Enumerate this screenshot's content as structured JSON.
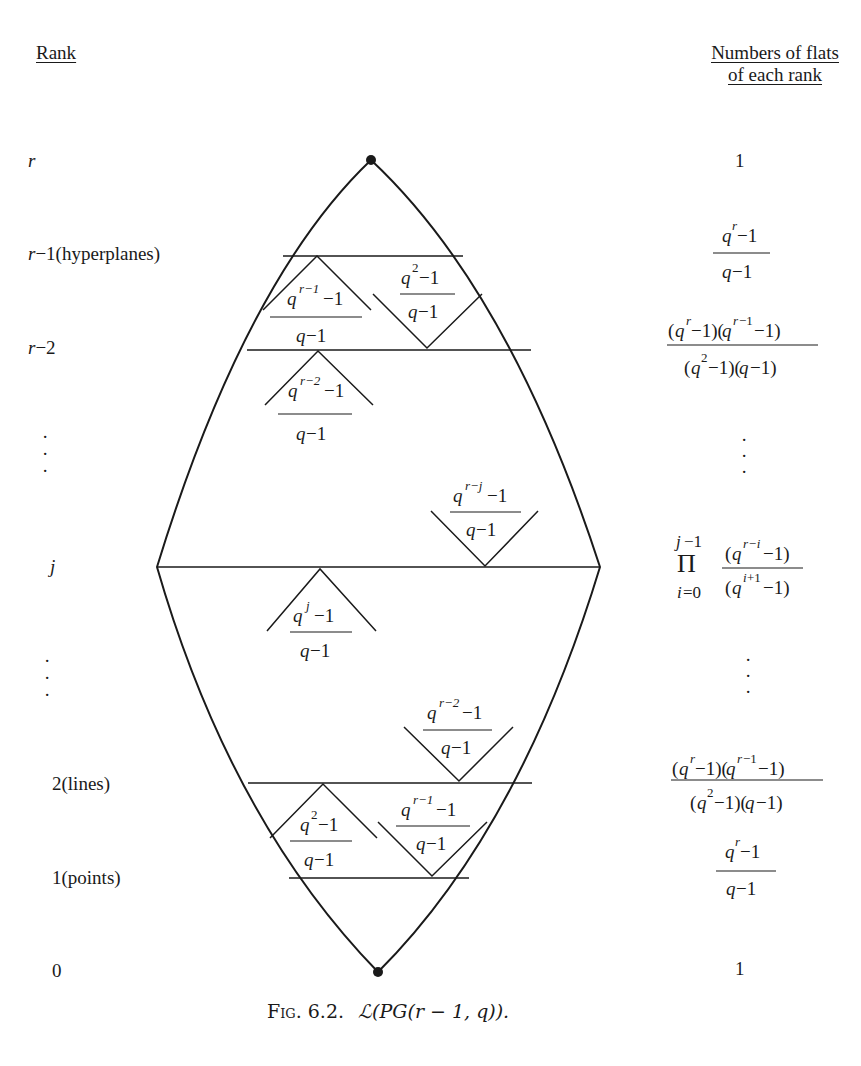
{
  "headers": {
    "rank": "Rank",
    "count_line1": "Numbers of flats",
    "count_line2": "of each rank"
  },
  "ranks": [
    {
      "label": "r",
      "italic": true
    },
    {
      "label": "r−1(hyperplanes)"
    },
    {
      "label": "r−2"
    },
    {
      "label": "⋮"
    },
    {
      "label": "j"
    },
    {
      "label": "⋮"
    },
    {
      "label": "2(lines)"
    },
    {
      "label": "1(points)"
    },
    {
      "label": "0"
    }
  ],
  "counts": {
    "r": "1",
    "r_minus_1": {
      "num_base": "q",
      "num_exp": "r",
      "num_tail": "−1",
      "den": "q−1"
    },
    "r_minus_2": {
      "num": "(q^r−1)(q^{r−1}−1)",
      "den": "(q^2−1)(q−1)"
    },
    "dots_upper": "⋮",
    "j": {
      "prod_top": "j−1",
      "prod_symbol": "Π",
      "prod_bottom": "i=0",
      "num": "(q^{r−i}−1)",
      "den": "(q^{i+1}−1)"
    },
    "dots_lower": "⋮",
    "two": {
      "num": "(q^r−1)(q^{r−1}−1)",
      "den": "(q^2−1)(q−1)"
    },
    "one": {
      "num": "q^r−1",
      "den": "q−1"
    },
    "zero": "1"
  },
  "wedge_labels": [
    {
      "id": "up-r-1",
      "exp": "r−1",
      "den": "q−1"
    },
    {
      "id": "down-2",
      "exp": "2",
      "den": "q−1"
    },
    {
      "id": "up-r-2",
      "exp": "r−2",
      "den": "q−1"
    },
    {
      "id": "down-r-j",
      "exp": "r−j",
      "den": "q−1"
    },
    {
      "id": "up-j",
      "exp": "j",
      "den": "q−1"
    },
    {
      "id": "down-r-2",
      "exp": "r−2",
      "den": "q−1"
    },
    {
      "id": "up-2",
      "exp": "2",
      "den": "q−1"
    },
    {
      "id": "down-r-1",
      "exp": "r−1",
      "den": "q−1"
    }
  ],
  "text_parts": {
    "q": "q",
    "minus_one": "−1"
  },
  "caption": {
    "fig": "Fig. 6.2.",
    "formula": "ℒ(PG(r − 1, q))."
  },
  "colors": {
    "ink": "#1a1a1a",
    "background": "#ffffff"
  }
}
